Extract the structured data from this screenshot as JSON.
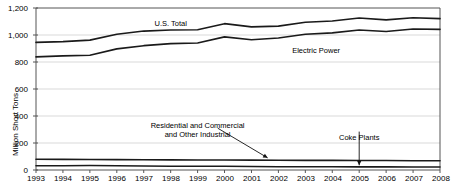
{
  "chart_data": {
    "type": "line",
    "title": "",
    "subtitle": "",
    "xlabel": "",
    "ylabel": "Million Short Tons",
    "xlim": [
      1993,
      2008
    ],
    "ylim": [
      0,
      1200
    ],
    "grid": true,
    "legend_position": "inline-annotations",
    "x": [
      1993,
      1994,
      1995,
      1996,
      1997,
      1998,
      1999,
      2000,
      2001,
      2002,
      2003,
      2004,
      2005,
      2006,
      2007,
      2008
    ],
    "xticklabels": [
      "1993",
      "1994",
      "1995",
      "1996",
      "1997",
      "1998",
      "1999",
      "2000",
      "2001",
      "2002",
      "2003",
      "2004",
      "2005",
      "2006",
      "2007",
      "2008"
    ],
    "yticks": [
      0,
      200,
      400,
      600,
      800,
      1000,
      1200
    ],
    "yticklabels": [
      "0",
      "200",
      "400",
      "600",
      "800",
      "1,000",
      "1,200"
    ],
    "series": [
      {
        "name": "U.S. Total",
        "values": [
          945,
          951,
          962,
          1006,
          1029,
          1037,
          1039,
          1084,
          1060,
          1066,
          1095,
          1104,
          1126,
          1112,
          1128,
          1121
        ]
      },
      {
        "name": "Electric Power",
        "values": [
          838,
          845,
          850,
          897,
          921,
          936,
          941,
          986,
          965,
          978,
          1005,
          1016,
          1037,
          1026,
          1045,
          1042
        ]
      },
      {
        "name": "Residential and Commercial and Other Industrial",
        "values": [
          80,
          79,
          78,
          77,
          76,
          75,
          74,
          74,
          73,
          72,
          71,
          71,
          70,
          70,
          69,
          68
        ]
      },
      {
        "name": "Coke Plants",
        "values": [
          31,
          31,
          33,
          32,
          30,
          28,
          28,
          28,
          26,
          24,
          24,
          24,
          23,
          23,
          22,
          22
        ]
      }
    ],
    "annotations": [
      {
        "id": "us-total",
        "text": "U.S. Total",
        "x": 1998.0,
        "y": 1085
      },
      {
        "id": "electric-power",
        "text": "Electric Power",
        "x": 2003.4,
        "y": 880
      },
      {
        "id": "residential",
        "text_line1": "Residential and Commercial",
        "text_line2": "and Other Industrial",
        "x": 1999.0,
        "y": 265,
        "arrow_to_x": 2001.6,
        "arrow_to_y": 90
      },
      {
        "id": "coke-plants",
        "text": "Coke Plants",
        "x": 2005.0,
        "y": 240,
        "arrow_to_x": 2005.0,
        "arrow_to_y": 35
      }
    ],
    "colors": {
      "line": "#1a1a1a",
      "grid": "#c8c8c8",
      "axis": "#555555",
      "background": "#ffffff"
    }
  }
}
